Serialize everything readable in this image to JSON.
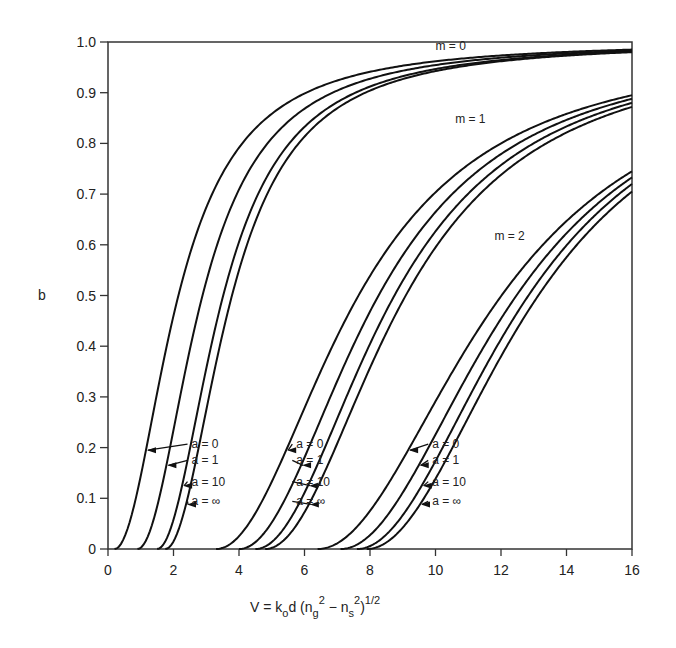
{
  "chart_data": {
    "type": "line",
    "title": "",
    "xlabel": "V = k_o d (n_g^2 − n_s^2)^1/2",
    "ylabel": "b",
    "xlim": [
      0,
      16
    ],
    "ylim": [
      0,
      1.0
    ],
    "grid": false,
    "x_ticks": [
      0,
      2,
      4,
      6,
      8,
      10,
      12,
      14,
      16
    ],
    "x_tick_labels": [
      "0",
      "2",
      "4",
      "6",
      "8",
      "10",
      "12",
      "14",
      "16"
    ],
    "y_ticks": [
      0,
      0.1,
      0.2,
      0.3,
      0.4,
      0.5,
      0.6,
      0.7,
      0.8,
      0.9,
      1.0
    ],
    "y_tick_labels": [
      "0",
      "0.1",
      "0.2",
      "0.3",
      "0.4",
      "0.5",
      "0.6",
      "0.7",
      "0.8",
      "0.9",
      "1.0"
    ],
    "mode_labels": [
      {
        "text": "m = 0",
        "x": 10.0,
        "y": 0.985
      },
      {
        "text": "m = 1",
        "x": 10.6,
        "y": 0.84
      },
      {
        "text": "m = 2",
        "x": 11.8,
        "y": 0.61
      }
    ],
    "series": [
      {
        "name": "m=0, a=0",
        "mode": 0,
        "a": "0",
        "cutoff": 0.2,
        "b_at_16": 0.985
      },
      {
        "name": "m=0, a=1",
        "mode": 0,
        "a": "1",
        "cutoff": 0.9,
        "b_at_16": 0.983
      },
      {
        "name": "m=0, a=10",
        "mode": 0,
        "a": "10",
        "cutoff": 1.5,
        "b_at_16": 0.981
      },
      {
        "name": "m=0, a=∞",
        "mode": 0,
        "a": "∞",
        "cutoff": 1.75,
        "b_at_16": 0.98
      },
      {
        "name": "m=1, a=0",
        "mode": 1,
        "a": "0",
        "cutoff": 3.3,
        "b_at_16": 0.895
      },
      {
        "name": "m=1, a=1",
        "mode": 1,
        "a": "1",
        "cutoff": 4.0,
        "b_at_16": 0.888
      },
      {
        "name": "m=1, a=10",
        "mode": 1,
        "a": "10",
        "cutoff": 4.5,
        "b_at_16": 0.88
      },
      {
        "name": "m=1, a=∞",
        "mode": 1,
        "a": "∞",
        "cutoff": 4.8,
        "b_at_16": 0.872
      },
      {
        "name": "m=2, a=0",
        "mode": 2,
        "a": "0",
        "cutoff": 6.4,
        "b_at_16": 0.745
      },
      {
        "name": "m=2, a=1",
        "mode": 2,
        "a": "1",
        "cutoff": 7.1,
        "b_at_16": 0.733
      },
      {
        "name": "m=2, a=10",
        "mode": 2,
        "a": "10",
        "cutoff": 7.6,
        "b_at_16": 0.72
      },
      {
        "name": "m=2, a=∞",
        "mode": 2,
        "a": "∞",
        "cutoff": 7.9,
        "b_at_16": 0.705
      }
    ],
    "legend_groups": [
      {
        "mode": 0,
        "labels": [
          "a = 0",
          "a = 1",
          "a = 10",
          "a = ∞"
        ],
        "label_x": 2.55,
        "arrow_b": [
          0.195,
          0.165,
          0.125,
          0.088
        ]
      },
      {
        "mode": 1,
        "labels": [
          "a = 0",
          "a = 1",
          "a = 10",
          "a = ∞"
        ],
        "label_x": 5.75,
        "arrow_b": [
          0.195,
          0.165,
          0.125,
          0.088
        ]
      },
      {
        "mode": 2,
        "labels": [
          "a = 0",
          "a = 1",
          "a = 10",
          "a = ∞"
        ],
        "label_x": 9.9,
        "arrow_b": [
          0.195,
          0.165,
          0.125,
          0.088
        ]
      }
    ]
  }
}
